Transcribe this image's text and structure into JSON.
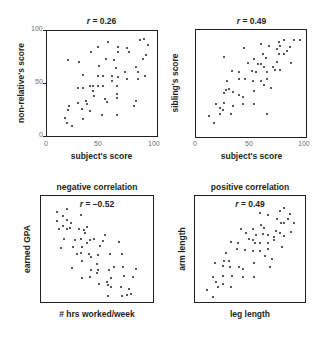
{
  "chart_data": [
    {
      "type": "scatter",
      "title": "r = 0.26",
      "r_value": "0.26",
      "xlabel": "subject's score",
      "ylabel": "non-relative's score",
      "xlim": [
        0,
        100
      ],
      "ylim": [
        0,
        100
      ],
      "xticks": [
        "0",
        "50",
        "100"
      ],
      "yticks": [
        "0",
        "50",
        "100"
      ],
      "grid": false,
      "points": [
        [
          55.8,
          89.4
        ],
        [
          64.7,
          84.9
        ],
        [
          64.7,
          79.8
        ],
        [
          72.4,
          83.7
        ],
        [
          74.8,
          79.8
        ],
        [
          84.3,
          91.3
        ],
        [
          87.8,
          92
        ],
        [
          91.4,
          86.2
        ],
        [
          89.6,
          77.2
        ],
        [
          87.2,
          73.4
        ],
        [
          46.3,
          84.9
        ],
        [
          39.8,
          80.4
        ],
        [
          19,
          72.1
        ],
        [
          29.1,
          70.8
        ],
        [
          32.6,
          58
        ],
        [
          53.4,
          73.4
        ],
        [
          60.5,
          72.1
        ],
        [
          62.9,
          64.4
        ],
        [
          47.5,
          67
        ],
        [
          64.1,
          56.1
        ],
        [
          71.2,
          60.6
        ],
        [
          72.4,
          54.2
        ],
        [
          58.8,
          56.7
        ],
        [
          51,
          56.7
        ],
        [
          46.3,
          56.7
        ],
        [
          81.3,
          65.7
        ],
        [
          83.1,
          60.6
        ],
        [
          82.5,
          54.2
        ],
        [
          89,
          56.7
        ],
        [
          32.6,
          45.8
        ],
        [
          27.9,
          45.8
        ],
        [
          39.2,
          47.8
        ],
        [
          42.1,
          47.8
        ],
        [
          46.3,
          47.8
        ],
        [
          42.1,
          42.6
        ],
        [
          42.7,
          38.1
        ],
        [
          51,
          47.8
        ],
        [
          63.5,
          47.8
        ],
        [
          58.8,
          52.2
        ],
        [
          63.5,
          40.1
        ],
        [
          52.8,
          35.6
        ],
        [
          54.6,
          32.4
        ],
        [
          63.5,
          36.2
        ],
        [
          35.6,
          33
        ],
        [
          36.8,
          30.4
        ],
        [
          27.9,
          31.1
        ],
        [
          19.6,
          28.5
        ],
        [
          19,
          24.7
        ],
        [
          31.5,
          26
        ],
        [
          39.2,
          24
        ],
        [
          16.6,
          17.6
        ],
        [
          17.8,
          12.5
        ],
        [
          22.6,
          9.9
        ],
        [
          32.6,
          16.3
        ],
        [
          50.4,
          20.2
        ],
        [
          63.5,
          20.2
        ],
        [
          78.9,
          28.5
        ],
        [
          80.7,
          33.7
        ]
      ]
    },
    {
      "type": "scatter",
      "title": "r = 0.49",
      "r_value": "0.49",
      "xlabel": "subject's score",
      "ylabel": "sibling's score",
      "xlim": [
        0,
        100
      ],
      "ylim": [
        0,
        100
      ],
      "xticks": [
        "0",
        "50",
        "100"
      ],
      "yticks": [],
      "grid": false,
      "points": [
        [
          88.7,
          90.3
        ],
        [
          94.6,
          90.9
        ],
        [
          79.8,
          90.3
        ],
        [
          75,
          89.1
        ],
        [
          76.2,
          84.8
        ],
        [
          73.2,
          82.4
        ],
        [
          85.1,
          84.2
        ],
        [
          82.7,
          80
        ],
        [
          79.8,
          77.6
        ],
        [
          75.6,
          77.6
        ],
        [
          66.1,
          84.8
        ],
        [
          58.9,
          86.7
        ],
        [
          43.5,
          83
        ],
        [
          60.7,
          77.6
        ],
        [
          63.7,
          73.9
        ],
        [
          25,
          74.5
        ],
        [
          47,
          69.1
        ],
        [
          53,
          73.3
        ],
        [
          56,
          67.9
        ],
        [
          59.5,
          68.5
        ],
        [
          61.9,
          65.5
        ],
        [
          64.9,
          60.6
        ],
        [
          70.2,
          65.5
        ],
        [
          73.8,
          70.3
        ],
        [
          71.4,
          62.4
        ],
        [
          76.2,
          63
        ],
        [
          86.3,
          69.1
        ],
        [
          51.2,
          61.8
        ],
        [
          54.2,
          60.6
        ],
        [
          32.7,
          61.8
        ],
        [
          39.3,
          60.6
        ],
        [
          38.7,
          54.5
        ],
        [
          44.6,
          53.9
        ],
        [
          51.8,
          52.1
        ],
        [
          58.9,
          52.1
        ],
        [
          64.3,
          54.5
        ],
        [
          61.9,
          48.5
        ],
        [
          68.5,
          46.1
        ],
        [
          28.6,
          52.1
        ],
        [
          27.4,
          43.6
        ],
        [
          30.4,
          44.8
        ],
        [
          25.6,
          41.2
        ],
        [
          33.3,
          41.8
        ],
        [
          38.7,
          38.8
        ],
        [
          42.3,
          37.6
        ],
        [
          52.4,
          43
        ],
        [
          18.5,
          30.9
        ],
        [
          21.4,
          27.3
        ],
        [
          25.6,
          32.1
        ],
        [
          33.9,
          29.1
        ],
        [
          42.9,
          30.9
        ],
        [
          53,
          30.9
        ],
        [
          24.4,
          24.8
        ],
        [
          21.4,
          21.8
        ],
        [
          32.1,
          21.8
        ],
        [
          64.9,
          21.8
        ],
        [
          11.9,
          20
        ],
        [
          16.7,
          13.3
        ]
      ]
    },
    {
      "type": "scatter",
      "subtitle": "negative correlation",
      "title": "r = –0.52",
      "r_value": "–0.52",
      "xlabel": "# hrs worked/week",
      "ylabel": "earned GPA",
      "xticks": [],
      "yticks": [],
      "grid": false,
      "points": [
        [
          14.2,
          84.9
        ],
        [
          23.1,
          88.1
        ],
        [
          19.5,
          81.1
        ],
        [
          23.1,
          77.4
        ],
        [
          27.2,
          74.8
        ],
        [
          35.5,
          82.4
        ],
        [
          14.2,
          76.1
        ],
        [
          16,
          68.6
        ],
        [
          19.5,
          71.7
        ],
        [
          23.1,
          68.6
        ],
        [
          26,
          69.8
        ],
        [
          33.7,
          68.6
        ],
        [
          38.5,
          67.9
        ],
        [
          40.8,
          70.4
        ],
        [
          39.6,
          65.4
        ],
        [
          20.7,
          59.1
        ],
        [
          30.2,
          58.5
        ],
        [
          35.5,
          59.1
        ],
        [
          18.3,
          50.9
        ],
        [
          28.4,
          52.2
        ],
        [
          36.7,
          51.6
        ],
        [
          41.4,
          55.3
        ],
        [
          43.8,
          58.5
        ],
        [
          47.3,
          59.1
        ],
        [
          55,
          57.9
        ],
        [
          57.4,
          62.9
        ],
        [
          69.8,
          56.6
        ],
        [
          32.5,
          45.3
        ],
        [
          36.1,
          46.5
        ],
        [
          42.6,
          45.3
        ],
        [
          44.4,
          42.8
        ],
        [
          50.9,
          44
        ],
        [
          52.7,
          52.8
        ],
        [
          61.5,
          45.3
        ],
        [
          72.2,
          45.3
        ],
        [
          36.7,
          38.4
        ],
        [
          49.7,
          35.8
        ],
        [
          27.8,
          32.1
        ],
        [
          44.4,
          30.2
        ],
        [
          50.9,
          30.2
        ],
        [
          60.9,
          30.2
        ],
        [
          65.1,
          33.3
        ],
        [
          72.8,
          33.3
        ],
        [
          85.2,
          30.8
        ],
        [
          36.7,
          22.6
        ],
        [
          43.8,
          23.3
        ],
        [
          49.7,
          27
        ],
        [
          62.7,
          22.6
        ],
        [
          74,
          24.5
        ],
        [
          81.7,
          23.3
        ],
        [
          52.1,
          17
        ],
        [
          59.2,
          18.9
        ],
        [
          59.8,
          15.7
        ],
        [
          62.7,
          14.5
        ],
        [
          71.6,
          13.8
        ],
        [
          78.7,
          12.6
        ],
        [
          59.8,
          5.7
        ],
        [
          72.2,
          5.7
        ],
        [
          76.9,
          6.9
        ],
        [
          80.5,
          7.5
        ]
      ]
    },
    {
      "type": "scatter",
      "subtitle": "positive correlation",
      "title": "r = 0.49",
      "r_value": "0.49",
      "xlabel": "leg length",
      "ylabel": "arm length",
      "xticks": [],
      "yticks": [],
      "grid": false,
      "points": [
        [
          59.5,
          83.6
        ],
        [
          66.1,
          81.8
        ],
        [
          76.9,
          86.2
        ],
        [
          80.5,
          88.7
        ],
        [
          86.5,
          83
        ],
        [
          74.5,
          78.6
        ],
        [
          78.1,
          74.8
        ],
        [
          81.1,
          74.8
        ],
        [
          84.1,
          78
        ],
        [
          90.1,
          74.8
        ],
        [
          77.5,
          64.8
        ],
        [
          81.1,
          62.3
        ],
        [
          73.9,
          67.3
        ],
        [
          87.7,
          66
        ],
        [
          60.1,
          73
        ],
        [
          63.1,
          69.8
        ],
        [
          52.9,
          68.6
        ],
        [
          55.9,
          63.5
        ],
        [
          61.9,
          64.2
        ],
        [
          66.1,
          62.9
        ],
        [
          71.5,
          61.6
        ],
        [
          72.1,
          58.5
        ],
        [
          79.3,
          52.2
        ],
        [
          42,
          69.2
        ],
        [
          46.2,
          64.8
        ],
        [
          49.2,
          59.1
        ],
        [
          52.9,
          58.5
        ],
        [
          54.7,
          56
        ],
        [
          59.5,
          55.3
        ],
        [
          66.1,
          55.3
        ],
        [
          32.4,
          56.6
        ],
        [
          39,
          56
        ],
        [
          38.4,
          49.7
        ],
        [
          45,
          49.1
        ],
        [
          52.3,
          47.8
        ],
        [
          58.9,
          48.4
        ],
        [
          63.7,
          43.4
        ],
        [
          66.1,
          49.7
        ],
        [
          69.7,
          40.3
        ],
        [
          67.9,
          33.3
        ],
        [
          28.2,
          46.5
        ],
        [
          18,
          37.1
        ],
        [
          26.4,
          38.4
        ],
        [
          30.6,
          38.4
        ],
        [
          25.2,
          34
        ],
        [
          31.8,
          33.3
        ],
        [
          39.6,
          33.3
        ],
        [
          43.8,
          31.4
        ],
        [
          53.5,
          37.1
        ],
        [
          16.8,
          23.9
        ],
        [
          25.2,
          24.5
        ],
        [
          33.6,
          24.5
        ],
        [
          43.8,
          23.3
        ],
        [
          53.5,
          23.9
        ],
        [
          19.2,
          18.9
        ],
        [
          25.2,
          17
        ],
        [
          21,
          14.5
        ],
        [
          33,
          14.5
        ],
        [
          10.8,
          11.3
        ],
        [
          16.2,
          5
        ]
      ]
    }
  ]
}
